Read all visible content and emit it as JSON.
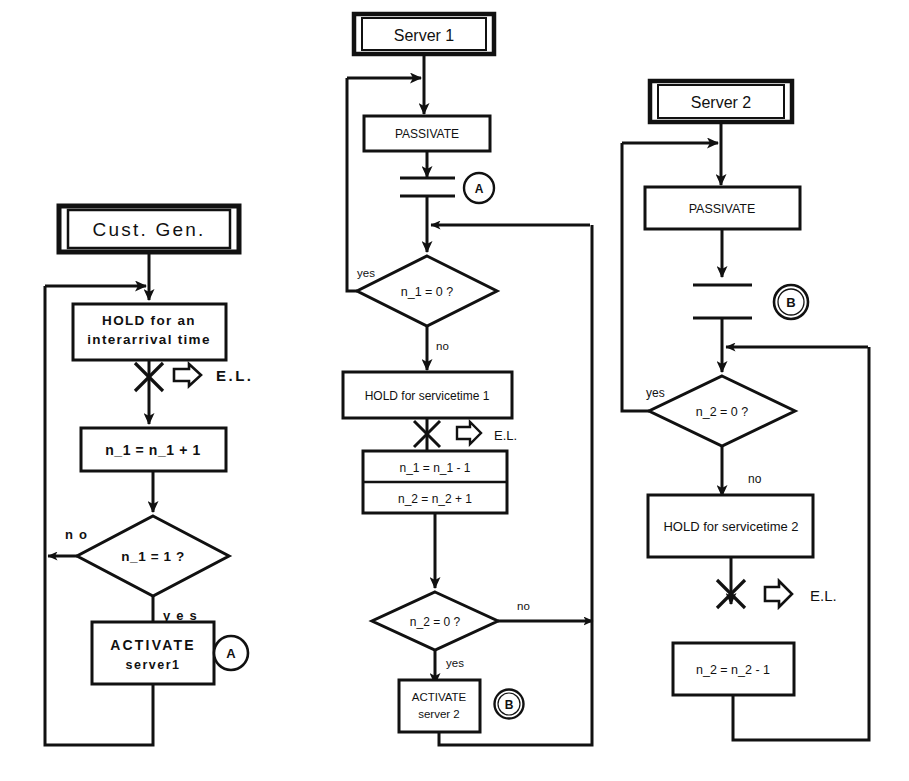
{
  "diagram": {
    "type": "flowchart",
    "stroke_color": "#111111",
    "fill_color": "#ffffff",
    "background": "#ffffff",
    "columns": [
      {
        "id": "cust-gen",
        "header": "Cust. Gen.",
        "nodes": [
          {
            "id": "hold-interarrival",
            "shape": "process",
            "lines": [
              "HOLD for an",
              "interarrival time"
            ]
          },
          {
            "id": "event-cross-1",
            "shape": "event-cross",
            "label": "E.L.",
            "arrow": "el-arrow"
          },
          {
            "id": "incr-n1",
            "shape": "process",
            "lines": [
              "n_1 = n_1 + 1"
            ]
          },
          {
            "id": "decide-n1-eq-1",
            "shape": "decision",
            "lines": [
              "n_1 = 1 ?"
            ],
            "branch_no": "no",
            "branch_yes": "yes"
          },
          {
            "id": "activate-server1",
            "shape": "process",
            "lines": [
              "ACTIVATE",
              "server1"
            ],
            "connector": "A"
          }
        ]
      },
      {
        "id": "server-1",
        "header": "Server 1",
        "nodes": [
          {
            "id": "passivate-1",
            "shape": "process",
            "lines": [
              "PASSIVATE"
            ]
          },
          {
            "id": "wait-bars-1",
            "shape": "wait-bars",
            "connector": "A"
          },
          {
            "id": "decide-n1-eq-0",
            "shape": "decision",
            "lines": [
              "n_1 = 0 ?"
            ],
            "branch_yes": "yes",
            "branch_no": "no"
          },
          {
            "id": "hold-servicetime-1",
            "shape": "process",
            "lines": [
              "HOLD for servicetime 1"
            ]
          },
          {
            "id": "event-cross-2",
            "shape": "event-cross",
            "label": "E.L.",
            "arrow": "el-arrow"
          },
          {
            "id": "update-counters-1",
            "shape": "process-split",
            "lines": [
              "n_1 = n_1 - 1",
              "n_2 = n_2 + 1"
            ]
          },
          {
            "id": "decide-n2-eq-0-mid",
            "shape": "decision",
            "lines": [
              "n_2 = 0 ?"
            ],
            "branch_no": "no",
            "branch_yes": "yes"
          },
          {
            "id": "activate-server2",
            "shape": "process",
            "lines": [
              "ACTIVATE",
              "server 2"
            ],
            "connector": "B"
          }
        ]
      },
      {
        "id": "server-2",
        "header": "Server 2",
        "nodes": [
          {
            "id": "passivate-2",
            "shape": "process",
            "lines": [
              "PASSIVATE"
            ]
          },
          {
            "id": "wait-bars-2",
            "shape": "wait-bars",
            "connector": "B"
          },
          {
            "id": "decide-n2-eq-0",
            "shape": "decision",
            "lines": [
              "n_2 = 0 ?"
            ],
            "branch_yes": "yes",
            "branch_no": "no"
          },
          {
            "id": "hold-servicetime-2",
            "shape": "process",
            "lines": [
              "HOLD for servicetime 2"
            ]
          },
          {
            "id": "event-cross-3",
            "shape": "event-cross",
            "label": "E.L.",
            "arrow": "el-arrow"
          },
          {
            "id": "decr-n2",
            "shape": "process",
            "lines": [
              "n_2 = n_2 - 1"
            ]
          }
        ]
      }
    ]
  },
  "labels": {
    "col1": {
      "header": "Cust. Gen.",
      "hold_l1": "HOLD for an",
      "hold_l2": "interarrival time",
      "el": "E.L.",
      "incr": "n_1  =  n_1  +  1",
      "decision": "n_1  =  1  ?",
      "no": "n o",
      "yes": "y e s",
      "activate_l1": "ACTIVATE",
      "activate_l2": "server1",
      "connector": "A"
    },
    "col2": {
      "header": "Server 1",
      "passivate": "PASSIVATE",
      "connector_top": "A",
      "decision1": "n_1 = 0 ?",
      "yes": "yes",
      "no": "no",
      "hold": "HOLD for servicetime 1",
      "el": "E.L.",
      "upd_l1": "n_1 = n_1 - 1",
      "upd_l2": "n_2 = n_2 + 1",
      "decision2": "n_2 = 0 ?",
      "no2": "no",
      "yes2": "yes",
      "activate_l1": "ACTIVATE",
      "activate_l2": "server 2",
      "connector_bottom": "B"
    },
    "col3": {
      "header": "Server 2",
      "passivate": "PASSIVATE",
      "connector_top": "B",
      "decision": "n_2 = 0 ?",
      "yes": "yes",
      "no": "no",
      "hold": "HOLD for servicetime 2",
      "el": "E.L.",
      "decr": "n_2 = n_2 - 1"
    }
  }
}
